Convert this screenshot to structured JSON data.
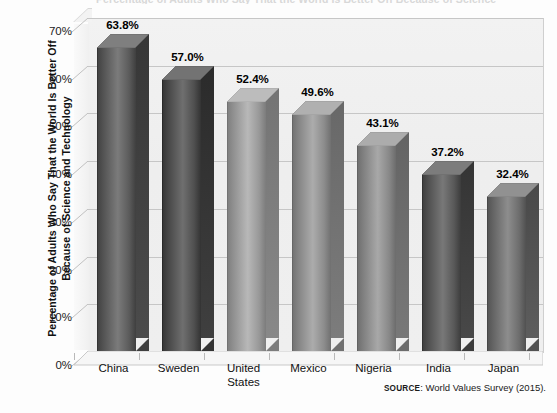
{
  "figure": {
    "clipped_title": "Percentage of Adults Who Say That the World Is Better Off Because of Science and Technology",
    "source_word": "SOURCE",
    "source_text": ": World Values Survey (2015)."
  },
  "axis": {
    "ylabel": "Percentage of Adults Who Say That the World Is Better Off Because of Science and Technology",
    "yticks": [
      "0%",
      "10%",
      "20%",
      "30%",
      "40%",
      "50%",
      "60%",
      "70%"
    ]
  },
  "chart_data": {
    "type": "bar",
    "title": "Percentage of Adults Who Say That the World Is Better Off Because of Science and Technology",
    "xlabel": "",
    "ylabel": "Percentage of Adults Who Say That the World Is Better Off Because of Science and Technology",
    "categories": [
      "China",
      "Sweden",
      "United States",
      "Mexico",
      "Nigeria",
      "India",
      "Japan"
    ],
    "values": [
      63.8,
      57.0,
      52.4,
      49.6,
      43.1,
      37.2,
      32.4
    ],
    "value_labels": [
      "63.8%",
      "57.0%",
      "52.4%",
      "49.6%",
      "43.1%",
      "37.2%",
      "32.4%"
    ],
    "ylim": [
      0,
      70
    ],
    "ytick_values": [
      0,
      10,
      20,
      30,
      40,
      50,
      60,
      70
    ],
    "ytick_labels": [
      "0%",
      "10%",
      "20%",
      "30%",
      "40%",
      "50%",
      "60%",
      "70%"
    ],
    "grid": true,
    "legend": false,
    "legend_position": "none",
    "three_d": true,
    "source": "SOURCE: World Values Survey (2015).",
    "bar_colors": [
      "#5d5d5d",
      "#515151",
      "#9a9a9a",
      "#8e8e8e",
      "#8a8a8a",
      "#5a5a5a",
      "#6f6f6f"
    ]
  },
  "colors": {
    "wall": "#efefef",
    "gridline": "#c6c6c6",
    "text": "#111111",
    "floor": "#f4f4f4"
  }
}
